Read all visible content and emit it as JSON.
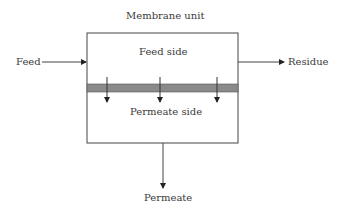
{
  "diagram": {
    "title": "Membrane unit",
    "feed_side_label": "Feed side",
    "permeate_side_label": "Permeate side",
    "inlet_label": "Feed",
    "residue_label": "Residue",
    "permeate_label": "Permeate",
    "colors": {
      "line": "#333333",
      "membrane": "#8a8a8a"
    }
  }
}
